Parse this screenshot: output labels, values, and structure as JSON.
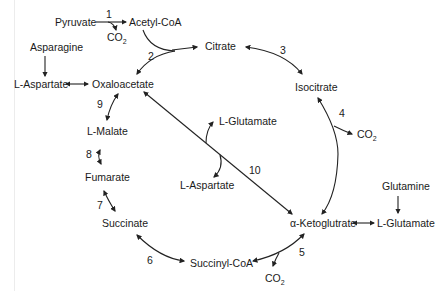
{
  "diagram": {
    "metabolites": {
      "pyruvate": "Pyruvate",
      "acetyl_coa": "Acetyl-CoA",
      "co2_1": "CO",
      "co2_1_sub": "2",
      "citrate": "Citrate",
      "isocitrate": "Isocitrate",
      "co2_4": "CO",
      "co2_4_sub": "2",
      "akg": "α-Ketoglutrate",
      "l_glutamate_right": "L-Glutamate",
      "glutamine": "Glutamine",
      "succinyl_coa": "Succinyl-CoA",
      "co2_5": "CO",
      "co2_5_sub": "2",
      "succinate": "Succinate",
      "fumarate": "Fumarate",
      "l_malate": "L-Malate",
      "oxaloacetate": "Oxaloacetate",
      "l_aspartate_left": "L-Aspartate",
      "asparagine": "Asparagine",
      "l_glutamate_center": "L-Glutamate",
      "l_aspartate_center": "L-Aspartate"
    },
    "steps": [
      "1",
      "2",
      "3",
      "4",
      "5",
      "6",
      "7",
      "8",
      "9",
      "10"
    ],
    "colors": {
      "line": "#222222",
      "text": "#1a1a1a",
      "background": "#ffffff"
    }
  }
}
